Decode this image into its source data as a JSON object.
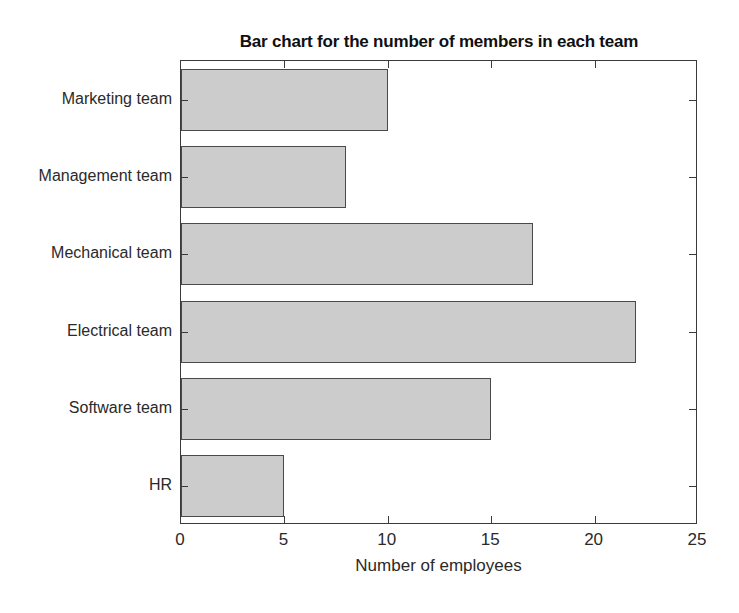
{
  "chart_data": {
    "type": "bar",
    "orientation": "horizontal",
    "title": "Bar chart for the number of members in each team",
    "xlabel": "Number of employees",
    "ylabel": "",
    "categories": [
      "HR",
      "Software team",
      "Electrical team",
      "Mechanical team",
      "Management team",
      "Marketing team"
    ],
    "values": [
      5,
      15,
      22,
      17,
      8,
      10
    ],
    "series": [
      {
        "name": "Number of employees",
        "values": [
          5,
          15,
          22,
          17,
          8,
          10
        ]
      }
    ],
    "xlim": [
      0,
      25
    ],
    "xticks": [
      0,
      5,
      10,
      15,
      20,
      25
    ],
    "xtick_labels": [
      "0",
      "5",
      "10",
      "15",
      "20",
      "25"
    ],
    "ytick_labels_top_to_bottom": [
      "Marketing team",
      "Management team",
      "Mechanical team",
      "Electrical team",
      "Software team",
      "HR"
    ],
    "grid": false,
    "legend": null,
    "bar_fill_color": "#cccccc",
    "bar_edge_color": "#4a4a4a",
    "axes_color": "#3a3a3a",
    "background_color": "#ffffff"
  },
  "bars_top_to_bottom": [
    {
      "label": "Marketing team",
      "value": 10
    },
    {
      "label": "Management team",
      "value": 8
    },
    {
      "label": "Mechanical team",
      "value": 17
    },
    {
      "label": "Electrical team",
      "value": 22
    },
    {
      "label": "Software team",
      "value": 15
    },
    {
      "label": "HR",
      "value": 5
    }
  ]
}
